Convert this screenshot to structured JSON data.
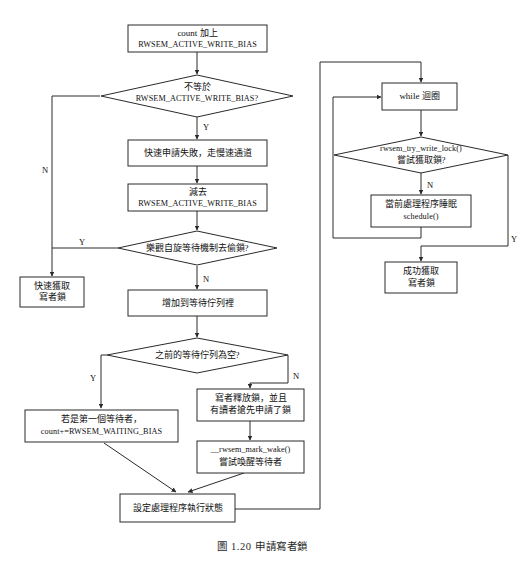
{
  "figure": {
    "caption": "圖 1.20  申請寫者鎖",
    "background_color": "#ffffff",
    "line_color": "#2a2a2a",
    "text_color": "#101010"
  },
  "nodes": {
    "count_add": {
      "type": "process",
      "line1": "count 加上",
      "line2": "RWSEM_ACTIVE_WRITE_BIAS"
    },
    "not_equal": {
      "type": "decision",
      "line1": "不等於",
      "line2": "RWSEM_ACTIVE_WRITE_BIAS?"
    },
    "fast_fail": {
      "type": "process",
      "line1": "快速申請失敗，走慢速通道"
    },
    "subtract": {
      "type": "process",
      "line1": "減去",
      "line2": "RWSEM_ACTIVE_WRITE_BIAS"
    },
    "optimistic_spin": {
      "type": "decision",
      "line1": "樂觀自旋等待機制去偷鎖?"
    },
    "fast_acquire": {
      "type": "process",
      "line1": "快速獲取",
      "line2": "寫者鎖"
    },
    "add_queue": {
      "type": "process",
      "line1": "增加到等待佇列裡"
    },
    "queue_empty": {
      "type": "decision",
      "line1": "之前的等待佇列為空?"
    },
    "first_waiter": {
      "type": "process",
      "line1": "若是第一個等待者，",
      "line2": "count+=RWSEM_WAITING_BIAS"
    },
    "writer_release": {
      "type": "process",
      "line1": "寫者釋放鎖，並且",
      "line2": "有讀者搶先申請了鎖"
    },
    "mark_wake": {
      "type": "process",
      "line1": "__rwsem_mark_wake()",
      "line2": "嘗試喚醒等待者"
    },
    "set_state": {
      "type": "process",
      "line1": "設定處理程序執行狀態"
    },
    "while_loop": {
      "type": "process",
      "line1": "while 迴圈"
    },
    "try_write_lock": {
      "type": "decision",
      "line1": "rwsem_try_write_lock()",
      "line2": "嘗試獲取鎖?"
    },
    "schedule": {
      "type": "process",
      "line1": "當前處理程序睡眠",
      "line2": "schedule()"
    },
    "success_acquire": {
      "type": "process",
      "line1": "成功獲取",
      "line2": "寫者鎖"
    }
  },
  "edge_labels": {
    "not_equal_no": "N",
    "not_equal_yes": "Y",
    "optimistic_yes": "Y",
    "optimistic_no": "N",
    "queue_empty_yes": "Y",
    "queue_empty_no": "N",
    "try_lock_no": "N",
    "try_lock_yes": "Y"
  }
}
